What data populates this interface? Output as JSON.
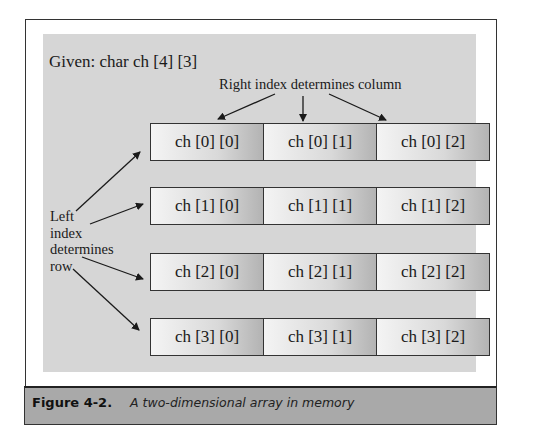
{
  "diagram": {
    "given_label": "Given: char ch [4] [3]",
    "right_index_label": "Right index determines column",
    "left_index_label_lines": [
      "Left",
      "index",
      "determines",
      "row"
    ],
    "rows": [
      [
        "ch [0] [0]",
        "ch [0] [1]",
        "ch [0] [2]"
      ],
      [
        "ch [1] [0]",
        "ch [1] [1]",
        "ch [1] [2]"
      ],
      [
        "ch [2] [0]",
        "ch [2] [1]",
        "ch [2] [2]"
      ],
      [
        "ch [3] [0]",
        "ch [3] [1]",
        "ch [3] [2]"
      ]
    ]
  },
  "caption": {
    "figure_number": "Figure 4-2.",
    "title": "A two-dimensional array in memory"
  },
  "colors": {
    "panel": "#d6d6d6",
    "caption_bar": "#a9a9a9",
    "border": "#333333"
  }
}
